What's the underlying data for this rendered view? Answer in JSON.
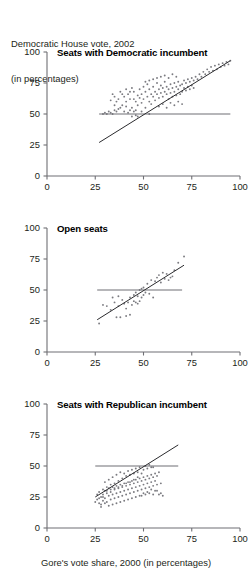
{
  "header": {
    "line1": "Democratic House vote, 2002",
    "line2": "(in percentages)"
  },
  "footer": {
    "xlabel": "Gore's vote share, 2000 (in percentages)"
  },
  "colors": {
    "axis": "#6f6f74",
    "point": "#7b7b80",
    "fit_line": "#2b2b2e",
    "ref_line": "#6f6f74",
    "text": "#231f20"
  },
  "chart_data": [
    {
      "type": "scatter",
      "title": "Seats with Democratic incumbent",
      "xlabel": "",
      "ylabel": "",
      "xlim": [
        0,
        100
      ],
      "ylim": [
        0,
        100
      ],
      "xticks": [
        0,
        25,
        50,
        75,
        100
      ],
      "yticks": [
        0,
        25,
        50,
        75,
        100
      ],
      "grid": false,
      "legend": "none",
      "reference_line": {
        "type": "horizontal",
        "y": 50,
        "x_start": 27,
        "x_end": 95
      },
      "fit_line": {
        "type": "linear",
        "x_start": 27,
        "y_start": 27,
        "x_end": 95,
        "y_end": 93
      },
      "points": [
        [
          29,
          50
        ],
        [
          30,
          51
        ],
        [
          31,
          50
        ],
        [
          32,
          52
        ],
        [
          33,
          51
        ],
        [
          34,
          50
        ],
        [
          35,
          53
        ],
        [
          36,
          52
        ],
        [
          33,
          61
        ],
        [
          34,
          66
        ],
        [
          35,
          57
        ],
        [
          36,
          60
        ],
        [
          37,
          54
        ],
        [
          38,
          55
        ],
        [
          39,
          57
        ],
        [
          40,
          52
        ],
        [
          41,
          56
        ],
        [
          42,
          51
        ],
        [
          43,
          53
        ],
        [
          38,
          68
        ],
        [
          40,
          64
        ],
        [
          41,
          70
        ],
        [
          42,
          66
        ],
        [
          43,
          62
        ],
        [
          44,
          71
        ],
        [
          45,
          68
        ],
        [
          46,
          60
        ],
        [
          44,
          55
        ],
        [
          45,
          52
        ],
        [
          46,
          49
        ],
        [
          47,
          57
        ],
        [
          48,
          63
        ],
        [
          48,
          70
        ],
        [
          49,
          66
        ],
        [
          50,
          62
        ],
        [
          50,
          72
        ],
        [
          51,
          68
        ],
        [
          52,
          64
        ],
        [
          52,
          74
        ],
        [
          53,
          70
        ],
        [
          53,
          60
        ],
        [
          54,
          66
        ],
        [
          54,
          58
        ],
        [
          55,
          72
        ],
        [
          55,
          64
        ],
        [
          56,
          68
        ],
        [
          56,
          61
        ],
        [
          57,
          75
        ],
        [
          57,
          66
        ],
        [
          58,
          70
        ],
        [
          58,
          63
        ],
        [
          59,
          73
        ],
        [
          59,
          67
        ],
        [
          60,
          71
        ],
        [
          60,
          64
        ],
        [
          61,
          76
        ],
        [
          61,
          68
        ],
        [
          62,
          72
        ],
        [
          62,
          66
        ],
        [
          63,
          70
        ],
        [
          63,
          62
        ],
        [
          64,
          74
        ],
        [
          64,
          67
        ],
        [
          65,
          71
        ],
        [
          65,
          64
        ],
        [
          66,
          75
        ],
        [
          66,
          68
        ],
        [
          67,
          72
        ],
        [
          67,
          65
        ],
        [
          68,
          76
        ],
        [
          68,
          70
        ],
        [
          69,
          73
        ],
        [
          69,
          66
        ],
        [
          70,
          74
        ],
        [
          70,
          68
        ],
        [
          71,
          77
        ],
        [
          71,
          71
        ],
        [
          72,
          75
        ],
        [
          72,
          69
        ],
        [
          73,
          78
        ],
        [
          73,
          72
        ],
        [
          74,
          76
        ],
        [
          74,
          70
        ],
        [
          75,
          79
        ],
        [
          75,
          73
        ],
        [
          76,
          77
        ],
        [
          76,
          71
        ],
        [
          77,
          80
        ],
        [
          78,
          78
        ],
        [
          79,
          82
        ],
        [
          80,
          80
        ],
        [
          81,
          84
        ],
        [
          82,
          82
        ],
        [
          83,
          86
        ],
        [
          84,
          84
        ],
        [
          85,
          88
        ],
        [
          86,
          85
        ],
        [
          87,
          89
        ],
        [
          88,
          86
        ],
        [
          89,
          90
        ],
        [
          90,
          88
        ],
        [
          91,
          91
        ],
        [
          92,
          89
        ],
        [
          93,
          92
        ],
        [
          94,
          90
        ],
        [
          95,
          93
        ],
        [
          47,
          48
        ],
        [
          49,
          52
        ],
        [
          51,
          55
        ],
        [
          53,
          50
        ],
        [
          45,
          62
        ],
        [
          47,
          65
        ],
        [
          49,
          59
        ],
        [
          43,
          68
        ],
        [
          37,
          62
        ],
        [
          39,
          66
        ],
        [
          41,
          60
        ],
        [
          35,
          64
        ],
        [
          44,
          48
        ],
        [
          46,
          53
        ],
        [
          58,
          56
        ],
        [
          60,
          58
        ],
        [
          62,
          55
        ],
        [
          64,
          59
        ],
        [
          66,
          57
        ],
        [
          68,
          60
        ],
        [
          70,
          58
        ],
        [
          59,
          80
        ],
        [
          61,
          81
        ],
        [
          63,
          79
        ],
        [
          65,
          82
        ],
        [
          67,
          80
        ],
        [
          55,
          78
        ],
        [
          57,
          79
        ],
        [
          53,
          77
        ],
        [
          51,
          76
        ]
      ]
    },
    {
      "type": "scatter",
      "title": "Open seats",
      "xlabel": "",
      "ylabel": "",
      "xlim": [
        0,
        100
      ],
      "ylim": [
        0,
        100
      ],
      "xticks": [
        0,
        25,
        50,
        75,
        100
      ],
      "yticks": [
        0,
        25,
        50,
        75,
        100
      ],
      "grid": false,
      "legend": "none",
      "reference_line": {
        "type": "horizontal",
        "y": 50,
        "x_start": 26,
        "x_end": 70
      },
      "fit_line": {
        "type": "linear",
        "x_start": 26,
        "y_start": 26,
        "x_end": 71,
        "y_end": 70
      },
      "points": [
        [
          27,
          23
        ],
        [
          29,
          38
        ],
        [
          33,
          34
        ],
        [
          35,
          40
        ],
        [
          36,
          28
        ],
        [
          37,
          37
        ],
        [
          38,
          28
        ],
        [
          39,
          42
        ],
        [
          40,
          39
        ],
        [
          41,
          35
        ],
        [
          42,
          40
        ],
        [
          43,
          44
        ],
        [
          44,
          38
        ],
        [
          45,
          41
        ],
        [
          45,
          46
        ],
        [
          46,
          48
        ],
        [
          46,
          40
        ],
        [
          47,
          45
        ],
        [
          47,
          39
        ],
        [
          48,
          50
        ],
        [
          48,
          41
        ],
        [
          49,
          51
        ],
        [
          49,
          44
        ],
        [
          50,
          52
        ],
        [
          50,
          46
        ],
        [
          51,
          48
        ],
        [
          52,
          55
        ],
        [
          53,
          47
        ],
        [
          54,
          58
        ],
        [
          55,
          44
        ],
        [
          56,
          57
        ],
        [
          57,
          60
        ],
        [
          58,
          62
        ],
        [
          59,
          56
        ],
        [
          60,
          64
        ],
        [
          61,
          59
        ],
        [
          62,
          63
        ],
        [
          63,
          58
        ],
        [
          64,
          60
        ],
        [
          65,
          61
        ],
        [
          66,
          66
        ],
        [
          68,
          72
        ],
        [
          71,
          77
        ],
        [
          43,
          30
        ],
        [
          41,
          29
        ],
        [
          37,
          45
        ],
        [
          34,
          44
        ],
        [
          31,
          37
        ]
      ]
    },
    {
      "type": "scatter",
      "title": "Seats with Republican incumbent",
      "xlabel": "Gore's vote share, 2000 (in percentages)",
      "ylabel": "",
      "xlim": [
        0,
        100
      ],
      "ylim": [
        0,
        100
      ],
      "xticks": [
        0,
        25,
        50,
        75,
        100
      ],
      "yticks": [
        0,
        25,
        50,
        75,
        100
      ],
      "grid": false,
      "legend": "none",
      "reference_line": {
        "type": "horizontal",
        "y": 50,
        "x_start": 25,
        "x_end": 68
      },
      "fit_line": {
        "type": "linear",
        "x_start": 25,
        "y_start": 25,
        "x_end": 68,
        "y_end": 67
      },
      "points": [
        [
          25,
          21
        ],
        [
          26,
          23
        ],
        [
          27,
          20
        ],
        [
          28,
          25
        ],
        [
          28,
          19
        ],
        [
          29,
          27
        ],
        [
          29,
          22
        ],
        [
          30,
          30
        ],
        [
          30,
          24
        ],
        [
          31,
          28
        ],
        [
          31,
          21
        ],
        [
          32,
          32
        ],
        [
          32,
          26
        ],
        [
          33,
          29
        ],
        [
          33,
          23
        ],
        [
          34,
          33
        ],
        [
          34,
          27
        ],
        [
          35,
          31
        ],
        [
          35,
          24
        ],
        [
          36,
          34
        ],
        [
          36,
          28
        ],
        [
          37,
          32
        ],
        [
          37,
          25
        ],
        [
          38,
          35
        ],
        [
          38,
          29
        ],
        [
          39,
          33
        ],
        [
          39,
          26
        ],
        [
          40,
          36
        ],
        [
          40,
          30
        ],
        [
          41,
          34
        ],
        [
          41,
          27
        ],
        [
          42,
          37
        ],
        [
          42,
          31
        ],
        [
          43,
          35
        ],
        [
          43,
          28
        ],
        [
          44,
          38
        ],
        [
          44,
          32
        ],
        [
          45,
          36
        ],
        [
          45,
          29
        ],
        [
          46,
          39
        ],
        [
          46,
          33
        ],
        [
          47,
          37
        ],
        [
          47,
          30
        ],
        [
          48,
          40
        ],
        [
          48,
          34
        ],
        [
          49,
          38
        ],
        [
          49,
          31
        ],
        [
          50,
          41
        ],
        [
          50,
          35
        ],
        [
          51,
          39
        ],
        [
          51,
          32
        ],
        [
          52,
          42
        ],
        [
          52,
          36
        ],
        [
          53,
          40
        ],
        [
          53,
          33
        ],
        [
          54,
          43
        ],
        [
          54,
          37
        ],
        [
          55,
          41
        ],
        [
          55,
          34
        ],
        [
          56,
          44
        ],
        [
          56,
          38
        ],
        [
          57,
          42
        ],
        [
          57,
          30
        ],
        [
          58,
          45
        ],
        [
          58,
          27
        ],
        [
          59,
          28
        ],
        [
          60,
          26
        ],
        [
          30,
          37
        ],
        [
          32,
          39
        ],
        [
          34,
          41
        ],
        [
          36,
          43
        ],
        [
          38,
          45
        ],
        [
          40,
          44
        ],
        [
          42,
          46
        ],
        [
          44,
          47
        ],
        [
          46,
          48
        ],
        [
          48,
          49
        ],
        [
          50,
          47
        ],
        [
          52,
          48
        ],
        [
          54,
          49
        ],
        [
          45,
          44
        ],
        [
          47,
          45
        ],
        [
          43,
          43
        ],
        [
          41,
          42
        ],
        [
          39,
          40
        ],
        [
          37,
          38
        ],
        [
          35,
          36
        ],
        [
          33,
          35
        ],
        [
          31,
          33
        ],
        [
          29,
          31
        ],
        [
          27,
          29
        ],
        [
          26,
          27
        ],
        [
          44,
          24
        ],
        [
          46,
          25
        ],
        [
          48,
          26
        ],
        [
          50,
          28
        ],
        [
          52,
          29
        ],
        [
          54,
          31
        ],
        [
          56,
          30
        ],
        [
          42,
          23
        ],
        [
          40,
          22
        ],
        [
          38,
          21
        ],
        [
          36,
          20
        ],
        [
          34,
          19
        ],
        [
          32,
          18
        ],
        [
          30,
          20
        ],
        [
          28,
          17
        ],
        [
          51,
          50
        ],
        [
          53,
          51
        ],
        [
          55,
          49
        ],
        [
          49,
          44
        ],
        [
          47,
          41
        ],
        [
          45,
          39
        ],
        [
          43,
          37
        ],
        [
          41,
          36
        ],
        [
          39,
          34
        ],
        [
          37,
          33
        ],
        [
          35,
          32
        ],
        [
          33,
          31
        ],
        [
          31,
          30
        ],
        [
          29,
          25
        ],
        [
          27,
          24
        ],
        [
          59,
          36
        ],
        [
          57,
          35
        ],
        [
          55,
          27
        ],
        [
          53,
          28
        ],
        [
          51,
          27
        ],
        [
          49,
          26
        ]
      ]
    }
  ]
}
